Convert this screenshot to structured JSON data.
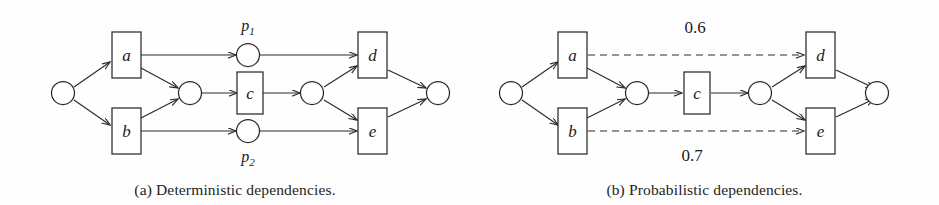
{
  "figure": {
    "panels": [
      {
        "id": "a",
        "caption": "(a) Deterministic dependencies.",
        "nodes": {
          "start": "",
          "a": "a",
          "b": "b",
          "join": "",
          "c": "c",
          "fork": "",
          "d": "d",
          "e": "e",
          "end": ""
        },
        "places": {
          "p1_base": "p",
          "p1_sub": "1",
          "p2_base": "p",
          "p2_sub": "2"
        }
      },
      {
        "id": "b",
        "caption": "(b) Probabilistic dependencies.",
        "nodes": {
          "start": "",
          "a": "a",
          "b": "b",
          "join": "",
          "c": "c",
          "fork": "",
          "d": "d",
          "e": "e",
          "end": ""
        },
        "weights": {
          "top": "0.6",
          "bottom": "0.7"
        }
      }
    ]
  },
  "colors": {
    "stroke": "#2a2a2a",
    "page_background": "#fefefe",
    "node_fill": "#ffffff",
    "text": "#1b1b1b"
  }
}
